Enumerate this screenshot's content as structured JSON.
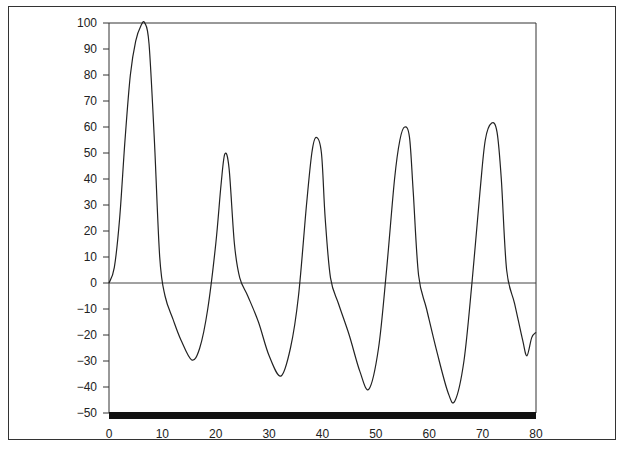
{
  "chart_data": {
    "type": "line",
    "title": "",
    "xlabel": "",
    "ylabel": "",
    "xlim": [
      0,
      80
    ],
    "ylim": [
      -50,
      100
    ],
    "grid": false,
    "legend": null,
    "x_ticks": [
      0,
      10,
      20,
      30,
      40,
      50,
      60,
      70,
      80
    ],
    "y_ticks": [
      100,
      90,
      80,
      70,
      60,
      50,
      40,
      30,
      20,
      10,
      0,
      -10,
      -20,
      -30,
      -40,
      -50
    ],
    "x_tick_labels": [
      "0",
      "10",
      "20",
      "30",
      "40",
      "50",
      "60",
      "70",
      "80"
    ],
    "y_tick_labels": [
      "100",
      "90",
      "80",
      "70",
      "60",
      "50",
      "40",
      "30",
      "20",
      "10",
      "0",
      "−10",
      "−20",
      "−30",
      "−40",
      "−50"
    ],
    "zero_line": true,
    "series": [
      {
        "name": "signal",
        "x": [
          0,
          1,
          2,
          3,
          4,
          5,
          6,
          6.7,
          7.5,
          8.5,
          9.5,
          10.5,
          12,
          13.5,
          15.5,
          17,
          18.5,
          20,
          21,
          21.7,
          22.5,
          23.5,
          24.5,
          26,
          28,
          30,
          32.2,
          34,
          35.5,
          37,
          38,
          38.8,
          39.8,
          40.5,
          41.5,
          43,
          45,
          47,
          48.7,
          50.5,
          52,
          53.5,
          54.5,
          55.4,
          56.3,
          57,
          58,
          59.5,
          61.5,
          63.5,
          64.8,
          66.5,
          68,
          69.5,
          70.5,
          71.7,
          72.7,
          73.5,
          74.5,
          76,
          77.5,
          78.3,
          79.2,
          80
        ],
        "y": [
          0,
          6,
          25,
          55,
          80,
          93,
          99,
          100,
          92,
          55,
          10,
          -5,
          -14,
          -22,
          -29.6,
          -25,
          -10,
          15,
          38,
          49.6,
          44,
          15,
          2,
          -5,
          -15,
          -28,
          -35.8,
          -25,
          -5,
          30,
          50,
          56,
          50,
          25,
          2,
          -8,
          -20,
          -34,
          -40.8,
          -25,
          5,
          40,
          55,
          60,
          56,
          35,
          3,
          -10,
          -27,
          -42,
          -45.4,
          -30,
          0,
          35,
          55,
          61.5,
          58,
          40,
          5,
          -8,
          -22,
          -28,
          -21,
          -19
        ]
      }
    ]
  }
}
